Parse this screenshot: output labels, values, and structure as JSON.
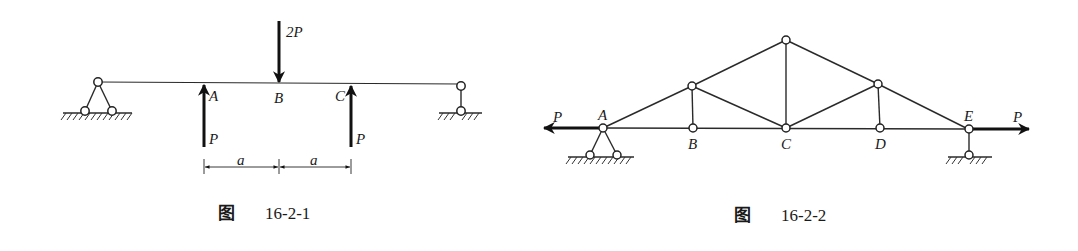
{
  "figures": [
    {
      "id": "fig1",
      "caption_prefix": "图",
      "caption_number": "16-2-1",
      "description": "Simply supported beam with pin support at left, roller at right; downward load 2P at B, upward loads P at A and C",
      "labels": {
        "A": "A",
        "B": "B",
        "C": "C"
      },
      "loads": {
        "center": "2P",
        "left": "P",
        "right": "P"
      },
      "dimensions": [
        "a",
        "a"
      ]
    },
    {
      "id": "fig2",
      "caption_prefix": "图",
      "caption_number": "16-2-2",
      "description": "Roof truss with pin support at A, roller at E; horizontal tension loads P at both ends",
      "labels": {
        "A": "A",
        "B": "B",
        "C": "C",
        "D": "D",
        "E": "E"
      },
      "loads": {
        "left": "P",
        "right": "P"
      }
    }
  ]
}
